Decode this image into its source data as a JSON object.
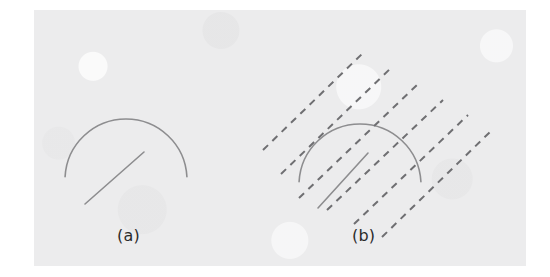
{
  "figure": {
    "background_color": "#ffffff",
    "panel_color": "#ececed",
    "panel": {
      "x": 34,
      "y": 10,
      "width": 492,
      "height": 256
    },
    "stroke_colors": {
      "shape_gray": "#8d8d8f",
      "dashed_gray": "#6f6f72",
      "label_text": "#2b2b2b"
    },
    "panels": [
      {
        "id": "a",
        "label": "(a)",
        "label_position": {
          "x": 117,
          "y": 226
        },
        "description": "gray open arc with a straight diagonal line segment inside",
        "shapes": [
          {
            "name": "arc",
            "type": "arc",
            "center": {
              "x": 126,
              "y": 180
            },
            "radius": 61,
            "start_angle_deg": 183,
            "end_angle_deg": 357,
            "stroke": "#8d8d8f",
            "stroke_width": 1.6,
            "start_point": {
              "x": 65,
              "y": 177
            },
            "apex_point": {
              "x": 126,
              "y": 119
            },
            "end_point": {
              "x": 187,
              "y": 183
            }
          },
          {
            "name": "line-segment",
            "type": "line",
            "from": {
              "x": 85,
              "y": 204
            },
            "to": {
              "x": 144,
              "y": 152
            },
            "stroke": "#8d8d8f",
            "stroke_width": 1.6
          }
        ]
      },
      {
        "id": "b",
        "label": "(b)",
        "label_position": {
          "x": 352,
          "y": 226
        },
        "description": "same arc and line segment overlaid by six parallel dashed lines at about 45 degrees rising to the right",
        "shapes": [
          {
            "name": "arc",
            "type": "arc",
            "center": {
              "x": 360,
              "y": 185
            },
            "radius": 61,
            "start_angle_deg": 183,
            "end_angle_deg": 357,
            "stroke": "#8d8d8f",
            "stroke_width": 1.6,
            "start_point": {
              "x": 299,
              "y": 182
            },
            "apex_point": {
              "x": 360,
              "y": 124
            },
            "end_point": {
              "x": 421,
              "y": 188
            }
          },
          {
            "name": "line-segment",
            "type": "line",
            "from": {
              "x": 318,
              "y": 208
            },
            "to": {
              "x": 368,
              "y": 153
            },
            "stroke": "#8d8d8f",
            "stroke_width": 1.6
          }
        ],
        "dashed_overlay": {
          "name": "parallel-dashed-lines",
          "count": 6,
          "angle_deg": 45,
          "stroke": "#6f6f72",
          "stroke_width": 2.0,
          "dash_pattern": "7 6",
          "lines": [
            {
              "from": {
                "x": 263,
                "y": 150
              },
              "to": {
                "x": 364,
                "y": 52
              }
            },
            {
              "from": {
                "x": 281,
                "y": 174
              },
              "to": {
                "x": 392,
                "y": 67
              }
            },
            {
              "from": {
                "x": 299,
                "y": 198
              },
              "to": {
                "x": 418,
                "y": 84
              }
            },
            {
              "from": {
                "x": 327,
                "y": 210
              },
              "to": {
                "x": 443,
                "y": 100
              }
            },
            {
              "from": {
                "x": 354,
                "y": 224
              },
              "to": {
                "x": 468,
                "y": 115
              }
            },
            {
              "from": {
                "x": 382,
                "y": 237
              },
              "to": {
                "x": 492,
                "y": 130
              }
            }
          ]
        }
      }
    ]
  }
}
